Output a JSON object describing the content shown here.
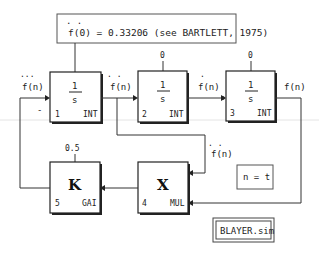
{
  "diagram": {
    "title_note": {
      "dots": ". .",
      "text": "f(0) = 0.33206 (see BARTLETT, 1975)"
    },
    "blocks": [
      {
        "id": 1,
        "num": "1",
        "type": "INT",
        "num_text": "1",
        "numerator": "1",
        "denominator": "s",
        "initial": ""
      },
      {
        "id": 2,
        "num": "2",
        "type": "INT",
        "numerator": "1",
        "denominator": "s",
        "initial": "0"
      },
      {
        "id": 3,
        "num": "3",
        "type": "INT",
        "numerator": "1",
        "denominator": "s",
        "initial": "0"
      },
      {
        "id": 4,
        "num": "4",
        "type": "MUL",
        "symbol": "X"
      },
      {
        "id": 5,
        "num": "5",
        "type": "GAI",
        "symbol": "K",
        "param": "0.5"
      }
    ],
    "signals": {
      "in1_dots": "...",
      "in1_label": "f(n)",
      "in1_sign": "-",
      "out1_dots": ". .",
      "out1_label": "f(n)",
      "out2_dot": ".",
      "out2_label": "f(n)",
      "out3_label": "f(n)",
      "branch_dots": ". .",
      "branch_label": "f(n)"
    },
    "condition_note": "n = t",
    "filename": "BLAYER.sim"
  }
}
